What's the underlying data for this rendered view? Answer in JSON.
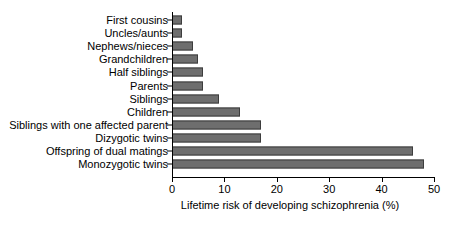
{
  "chart_data": {
    "type": "bar",
    "orientation": "horizontal",
    "title": "",
    "xlabel": "Lifetime risk of developing schizophrenia (%)",
    "ylabel": "",
    "xlim": [
      0,
      50
    ],
    "xticks": [
      0,
      10,
      20,
      30,
      40,
      50
    ],
    "xtick_labels": [
      "0",
      "10",
      "20",
      "30",
      "40",
      "50"
    ],
    "grid": false,
    "legend": null,
    "bar_color": "#6e6e6e",
    "bar_edge_color": "#3d3d3d",
    "categories": [
      "First cousins",
      "Uncles/aunts",
      "Nephews/nieces",
      "Grandchildren",
      "Half siblings",
      "Parents",
      "Siblings",
      "Children",
      "Siblings with one affected parent",
      "Dizygotic twins",
      "Offspring of dual matings",
      "Monozygotic twins"
    ],
    "values": [
      2,
      2,
      4,
      5,
      6,
      6,
      9,
      13,
      17,
      17,
      46,
      48
    ],
    "units": "%"
  }
}
